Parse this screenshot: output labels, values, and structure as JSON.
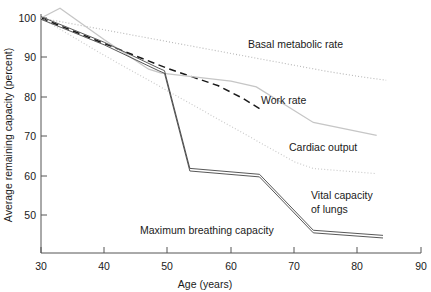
{
  "chart_data": {
    "type": "line",
    "title": "",
    "xlabel": "Age (years)",
    "ylabel": "Average remaining capacity (percent)",
    "xlim": [
      30,
      90
    ],
    "ylim": [
      44,
      103
    ],
    "xticks": [
      30,
      40,
      50,
      60,
      70,
      80,
      90
    ],
    "yticks": [
      50,
      60,
      70,
      80,
      90,
      100
    ],
    "grid": false,
    "legend_position": "inline-annotations",
    "series": [
      {
        "name": "Basal metabolic rate",
        "style": "dotted",
        "color": "#b9b9b9",
        "label_x": 58,
        "label_y": 94,
        "x": [
          30,
          35,
          40,
          45,
          50,
          55,
          60,
          65,
          70,
          75,
          80,
          84.5
        ],
        "y": [
          100,
          98.5,
          97.0,
          95.5,
          94.0,
          92.5,
          91.0,
          89.5,
          88.0,
          86.5,
          85.2,
          84.2
        ]
      },
      {
        "name": "Work rate",
        "style": "dashed",
        "color": "#1a1a1a",
        "label_x": 63.5,
        "label_y": 77.5,
        "x": [
          30,
          40,
          50,
          58,
          62,
          65
        ],
        "y": [
          100,
          93.5,
          87.2,
          82.8,
          79.5,
          76.5
        ]
      },
      {
        "name": "Cardiac output",
        "style": "solid",
        "color": "#c6c6c6",
        "label_x": 70.5,
        "label_y": 67.5,
        "x": [
          30,
          33,
          40,
          47,
          49,
          60,
          64,
          73,
          83
        ],
        "y": [
          100,
          102.5,
          94.5,
          87.0,
          86.0,
          84.0,
          82.5,
          73.5,
          70.2
        ]
      },
      {
        "name": "Vital capacity of lungs",
        "style": "dotted",
        "color": "#c9c9c9",
        "label_x": 74,
        "label_y": 56.5,
        "x": [
          30,
          40,
          50,
          60,
          70,
          73,
          83
        ],
        "y": [
          100,
          90.5,
          81.5,
          72.5,
          63.5,
          61.8,
          60.5
        ]
      },
      {
        "name": "Maximum breathing capacity",
        "style": "double-solid",
        "color": "#3a3a3a",
        "label_x": 44,
        "label_y": 48.5,
        "x": [
          30,
          40,
          48.5,
          49.5,
          53.5,
          64.5,
          73,
          84
        ],
        "y": [
          100,
          93.5,
          87.0,
          86.3,
          61.5,
          60.0,
          45.8,
          44.5
        ]
      }
    ]
  },
  "axes": {
    "x_tick_labels": [
      "30",
      "40",
      "50",
      "60",
      "70",
      "80",
      "90"
    ],
    "y_tick_labels": [
      "50",
      "60",
      "70",
      "80",
      "90",
      "100"
    ],
    "x_axis_title": "Age (years)",
    "y_axis_title": "Average remaining capacity (percent)"
  },
  "annotations": {
    "basal_metabolic_rate": "Basal metabolic rate",
    "work_rate": "Work rate",
    "cardiac_output": "Cardiac output",
    "vital_capacity_line1": "Vital capacity",
    "vital_capacity_line2": "of lungs",
    "maximum_breathing_capacity": "Maximum breathing capacity"
  }
}
